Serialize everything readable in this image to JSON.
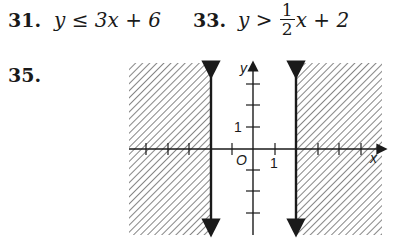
{
  "problems": [
    {
      "number": "31.",
      "inequality": {
        "lhs": "y",
        "op": "≤",
        "rhs": "3x + 6"
      }
    },
    {
      "number": "33.",
      "inequality": {
        "lhs": "y",
        "op": ">",
        "frac_num": "1",
        "frac_den": "2",
        "rhs_tail": "x + 2"
      }
    },
    {
      "number": "35."
    }
  ],
  "graph": {
    "x_label": "x",
    "y_label": "y",
    "origin_label": "O",
    "x_tick_label": "1",
    "y_tick_label": "1",
    "boundaries": [
      -2,
      2
    ],
    "shaded": "x ≤ -2 or x ≥ 2",
    "line_style": "solid",
    "colors": {
      "ink": "#1a1a1a",
      "background": "#ffffff"
    }
  }
}
